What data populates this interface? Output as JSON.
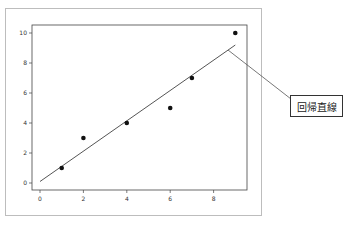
{
  "chart_data": {
    "type": "scatter",
    "title": "",
    "xlabel": "",
    "ylabel": "",
    "xlim": [
      -0.5,
      9.5
    ],
    "ylim": [
      -0.5,
      10.5
    ],
    "x_ticks": [
      "0",
      "2",
      "4",
      "6",
      "8"
    ],
    "y_ticks": [
      "0",
      "2",
      "4",
      "6",
      "8",
      "10"
    ],
    "grid": false,
    "series": [
      {
        "name": "data",
        "type": "scatter",
        "x": [
          1,
          2,
          4,
          6,
          7,
          9
        ],
        "y": [
          1,
          3,
          4,
          5,
          7,
          10
        ]
      },
      {
        "name": "回帰直線",
        "type": "line",
        "x": [
          0,
          9
        ],
        "y": [
          0.1,
          9.2
        ]
      }
    ],
    "annotations": [
      {
        "text": "回帰直線",
        "target": "regression line",
        "position": "right, outside plot"
      }
    ]
  },
  "annotation": {
    "label": "回帰直線"
  },
  "colors": {
    "points": "#111111",
    "line": "#555555",
    "frame": "#bdbdbd"
  }
}
